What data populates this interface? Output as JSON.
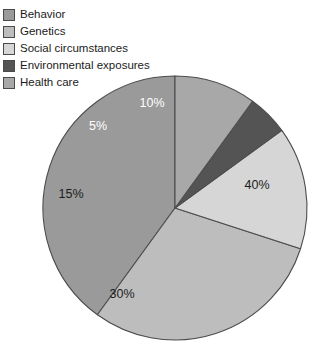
{
  "figure": {
    "background": "#ffffff",
    "outline_color": "#4d4d4d"
  },
  "legend": {
    "position": "top-left",
    "items": [
      {
        "label": "Behavior",
        "color": "#9a9a9a",
        "swatch_name": "legend-swatch-behavior"
      },
      {
        "label": "Genetics",
        "color": "#bdbdbd",
        "swatch_name": "legend-swatch-genetics"
      },
      {
        "label": "Social circumstances",
        "color": "#d6d6d6",
        "swatch_name": "legend-swatch-social-circumstances"
      },
      {
        "label": "Environmental exposures",
        "color": "#545454",
        "swatch_name": "legend-swatch-environmental-exposures"
      },
      {
        "label": "Health care",
        "color": "#a8a8a8",
        "swatch_name": "legend-swatch-health-care"
      }
    ]
  },
  "chart_data": {
    "type": "pie",
    "title": "",
    "xlabel": "",
    "ylabel": "",
    "legend_position": "top-left",
    "grid": false,
    "start_angle_deg": 0,
    "direction": "counterclockwise",
    "categories": [
      "Behavior",
      "Genetics",
      "Social circumstances",
      "Environmental exposures",
      "Health care"
    ],
    "values": [
      40,
      30,
      15,
      5,
      10
    ],
    "units": "percent",
    "slices": [
      {
        "label": "Behavior",
        "value": 40,
        "display": "40%",
        "color": "#9a9a9a",
        "label_color": "dark",
        "label_x": 257,
        "label_y": 186
      },
      {
        "label": "Genetics",
        "value": 30,
        "display": "30%",
        "color": "#bdbdbd",
        "label_color": "dark",
        "label_x": 122,
        "label_y": 295
      },
      {
        "label": "Social circumstances",
        "value": 15,
        "display": "15%",
        "color": "#d6d6d6",
        "label_color": "dark",
        "label_x": 71,
        "label_y": 195
      },
      {
        "label": "Environmental exposures",
        "value": 5,
        "display": "5%",
        "color": "#545454",
        "label_color": "light",
        "label_x": 98,
        "label_y": 127
      },
      {
        "label": "Health care",
        "value": 10,
        "display": "10%",
        "color": "#a8a8a8",
        "label_color": "light",
        "label_x": 152,
        "label_y": 104
      }
    ],
    "geometry": {
      "cx": 175,
      "cy": 208,
      "r": 132
    }
  }
}
